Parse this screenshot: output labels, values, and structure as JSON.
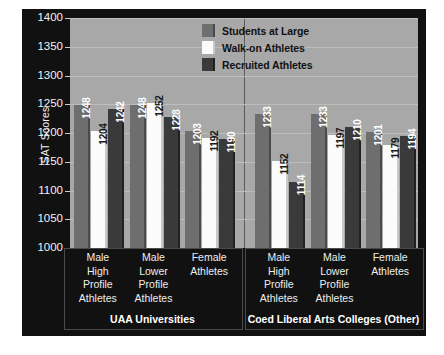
{
  "chart_data": {
    "type": "bar",
    "title": "",
    "xlabel": "",
    "ylabel": "SAT Scores",
    "ylim": [
      1000,
      1400
    ],
    "yticks": [
      1000,
      1050,
      1100,
      1150,
      1200,
      1250,
      1300,
      1350,
      1400
    ],
    "grid": true,
    "legend_position": "top-right",
    "group_titles": [
      "UAA Universities",
      "Coed Liberal Arts Colleges (Other)"
    ],
    "categories": [
      "Male High Profile Athletes",
      "Male Lower Profile Athletes",
      "Female Athletes",
      "Male High Profile Athletes",
      "Male Lower Profile Athletes",
      "Female Athletes"
    ],
    "category_lines": [
      [
        "Male",
        "High",
        "Profile",
        "Athletes"
      ],
      [
        "Male",
        "Lower",
        "Profile",
        "Athletes"
      ],
      [
        "Female",
        "Athletes"
      ],
      [
        "Male",
        "High",
        "Profile",
        "Athletes"
      ],
      [
        "Male",
        "Lower",
        "Profile",
        "Athletes"
      ],
      [
        "Female",
        "Athletes"
      ]
    ],
    "series": [
      {
        "name": "Students at Large",
        "color": "#6e6e6e",
        "edge": "#4a4a4a",
        "label_color": "dark",
        "values": [
          1248,
          1248,
          1203,
          1233,
          1233,
          1201
        ]
      },
      {
        "name": "Walk-on Athletes",
        "color": "#fbfbfb",
        "edge": "#c9c9c9",
        "label_color": "light",
        "values": [
          1204,
          1252,
          1192,
          1152,
          1197,
          1179
        ]
      },
      {
        "name": "Recruited Athletes",
        "color": "#3a3a3a",
        "edge": "#212121",
        "label_color": "dark",
        "values": [
          1242,
          1228,
          1190,
          1114,
          1210,
          1194
        ]
      }
    ]
  },
  "legend": {
    "items": [
      {
        "label": "Students at Large"
      },
      {
        "label": "Walk-on Athletes"
      },
      {
        "label": "Recruited Athletes"
      }
    ]
  },
  "colors": {
    "panel_background": "#111111",
    "plot_background": "#a8a8a8",
    "gridline": "#bdbdbd",
    "separator": "#5a5a5a",
    "axis_text": "#f2f2f2"
  }
}
